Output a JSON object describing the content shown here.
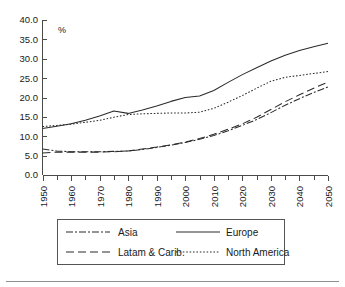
{
  "chart_data": {
    "type": "line",
    "title": "",
    "subtitle": "",
    "unit_label": "%",
    "xlabel": "",
    "ylabel": "",
    "xlim": [
      1950,
      2050
    ],
    "ylim": [
      0,
      40
    ],
    "grid": false,
    "legend_position": "bottom",
    "x": [
      1950,
      1955,
      1960,
      1965,
      1970,
      1975,
      1980,
      1985,
      1990,
      1995,
      2000,
      2005,
      2010,
      2015,
      2020,
      2025,
      2030,
      2035,
      2040,
      2045,
      2050
    ],
    "y_ticks": [
      0.0,
      5.0,
      10.0,
      15.0,
      20.0,
      25.0,
      30.0,
      35.0,
      40.0
    ],
    "y_tick_labels": [
      "0.0",
      "5.0",
      "10.0",
      "15.0",
      "20.0",
      "25.0",
      "30.0",
      "35.0",
      "40.0"
    ],
    "x_ticks": [
      1950,
      1960,
      1970,
      1980,
      1990,
      2000,
      2010,
      2020,
      2030,
      2040,
      2050
    ],
    "x_tick_labels": [
      "1950",
      "1960",
      "1970",
      "1980",
      "1990",
      "2000",
      "2010",
      "2020",
      "2030",
      "2040",
      "2050"
    ],
    "x_minor_ticks": [
      1955,
      1965,
      1975,
      1985,
      1995,
      2005,
      2015,
      2025,
      2035,
      2045
    ],
    "series": [
      {
        "name": "Asia",
        "style": "dashdot",
        "dasharray": "7,2,2,2",
        "values": [
          6.7,
          6.2,
          6.0,
          6.0,
          6.0,
          6.1,
          6.2,
          6.6,
          7.1,
          7.7,
          8.4,
          9.2,
          10.2,
          11.4,
          12.8,
          14.3,
          16.1,
          18.0,
          19.7,
          21.3,
          22.7
        ]
      },
      {
        "name": "Europe",
        "style": "solid",
        "dasharray": "",
        "values": [
          12.0,
          12.6,
          13.2,
          14.1,
          15.2,
          16.5,
          15.9,
          16.8,
          17.8,
          19.0,
          20.0,
          20.4,
          21.8,
          23.9,
          25.9,
          27.7,
          29.4,
          30.9,
          32.1,
          33.1,
          34.0
        ]
      },
      {
        "name": "Latam & Carib.",
        "style": "dashed",
        "dasharray": "8,4",
        "values": [
          5.7,
          5.9,
          5.9,
          5.9,
          5.9,
          6.0,
          6.2,
          6.7,
          7.2,
          7.8,
          8.5,
          9.4,
          10.5,
          11.8,
          13.2,
          14.9,
          16.9,
          18.9,
          20.7,
          22.4,
          24.0
        ]
      },
      {
        "name": "North America",
        "style": "dotted",
        "dasharray": "1.6,1.8",
        "values": [
          12.5,
          12.8,
          13.1,
          13.6,
          14.1,
          14.9,
          15.6,
          15.8,
          15.9,
          16.0,
          16.0,
          16.2,
          17.2,
          18.8,
          20.5,
          22.4,
          24.2,
          25.2,
          25.7,
          26.2,
          26.7
        ]
      }
    ],
    "legend": [
      {
        "label": "Asia",
        "dasharray": "7,2,2,2"
      },
      {
        "label": "Europe",
        "dasharray": ""
      },
      {
        "label": "Latam & Carib.",
        "dasharray": "8,4"
      },
      {
        "label": "North America",
        "dasharray": "1.6,1.8"
      }
    ]
  }
}
